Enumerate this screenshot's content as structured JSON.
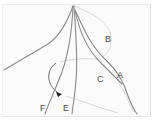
{
  "diagram": {
    "type": "anatomical line sketch",
    "labels": [
      {
        "id": "A",
        "text": "A",
        "x": 117,
        "y": 71
      },
      {
        "id": "B",
        "text": "B",
        "x": 105,
        "y": 35
      },
      {
        "id": "C",
        "text": "C",
        "x": 97,
        "y": 75
      },
      {
        "id": "E",
        "text": "E",
        "x": 63,
        "y": 104
      },
      {
        "id": "F",
        "text": "F",
        "x": 40,
        "y": 104
      }
    ],
    "colors": {
      "line": "#8a8a8a",
      "faint_line": "#c8c8c8",
      "label": "#4a4a4a",
      "arrow": "#222222"
    }
  }
}
